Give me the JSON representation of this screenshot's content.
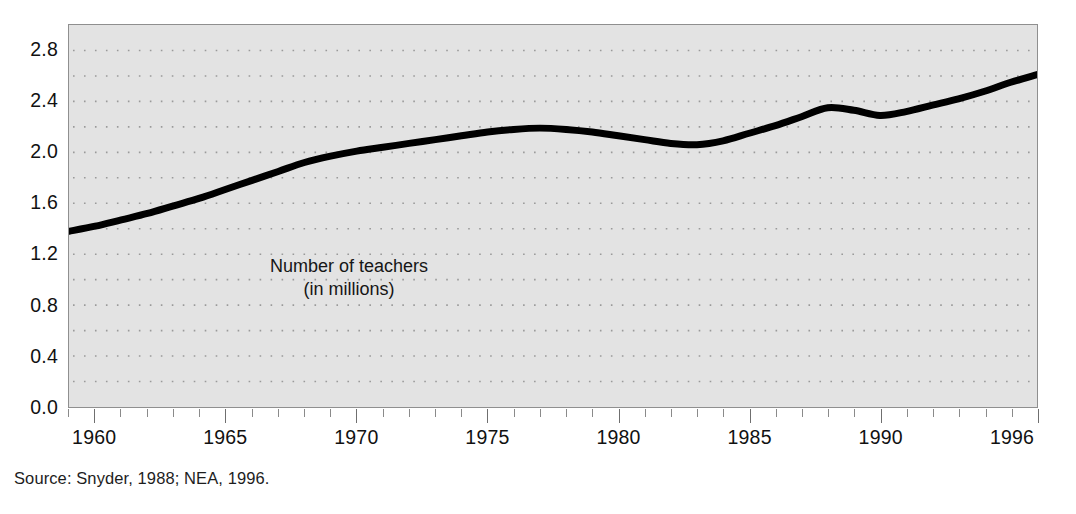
{
  "figure": {
    "background_color": "#ffffff",
    "plot_background_color": "#e3e3e3",
    "frame_color": "#8f8f8f",
    "series_color": "#000000",
    "gridline_color": "#9a9a9a"
  },
  "annotation": {
    "line1": "Number of teachers",
    "line2": "(in millions)"
  },
  "source": {
    "text": "Source: Snyder, 1988; NEA, 1996."
  },
  "chart_data": {
    "type": "line",
    "title": "",
    "subtitle": "",
    "xlabel": "",
    "ylabel": "",
    "annotations": [
      "Number of teachers",
      "(in millions)"
    ],
    "source": "Source: Snyder, 1988; NEA, 1996.",
    "grid": true,
    "grid_style": "dotted-horizontal",
    "legend": false,
    "xlim": [
      1959,
      1996
    ],
    "ylim": [
      0.0,
      3.0
    ],
    "y_tick_labels": [
      "0.0",
      "0.4",
      "0.8",
      "1.2",
      "1.6",
      "2.0",
      "2.4",
      "2.8"
    ],
    "y_tick_values": [
      0.0,
      0.4,
      0.8,
      1.2,
      1.6,
      2.0,
      2.4,
      2.8
    ],
    "y_gridline_values": [
      0.2,
      0.4,
      0.6,
      0.8,
      1.0,
      1.2,
      1.4,
      1.6,
      1.8,
      2.0,
      2.2,
      2.4,
      2.6,
      2.8
    ],
    "x_tick_labels": [
      "1960",
      "1965",
      "1970",
      "1975",
      "1980",
      "1985",
      "1990",
      "1996"
    ],
    "x_tick_values": [
      1960,
      1965,
      1970,
      1975,
      1980,
      1985,
      1990,
      1996
    ],
    "x_minor_tick_interval": 1,
    "series": [
      {
        "name": "Number of teachers (in millions)",
        "color": "#000000",
        "line_width": 7,
        "x": [
          1959,
          1960,
          1961,
          1962,
          1963,
          1964,
          1965,
          1966,
          1967,
          1968,
          1969,
          1970,
          1971,
          1972,
          1973,
          1974,
          1975,
          1976,
          1977,
          1978,
          1979,
          1980,
          1981,
          1982,
          1983,
          1984,
          1985,
          1986,
          1987,
          1988,
          1989,
          1990,
          1991,
          1992,
          1993,
          1994,
          1995,
          1996
        ],
        "values": [
          1.38,
          1.42,
          1.47,
          1.52,
          1.58,
          1.64,
          1.71,
          1.78,
          1.85,
          1.92,
          1.97,
          2.01,
          2.04,
          2.07,
          2.1,
          2.13,
          2.16,
          2.18,
          2.19,
          2.18,
          2.16,
          2.13,
          2.1,
          2.07,
          2.06,
          2.09,
          2.15,
          2.21,
          2.28,
          2.35,
          2.33,
          2.29,
          2.32,
          2.37,
          2.42,
          2.48,
          2.55,
          2.61
        ]
      }
    ]
  }
}
